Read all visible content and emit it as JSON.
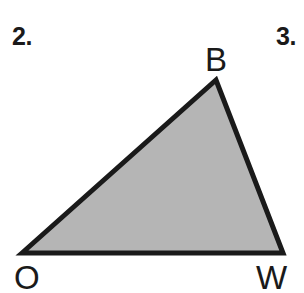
{
  "figure": {
    "background_color": "#ffffff",
    "problem_numbers": [
      {
        "name": "problem-number-2",
        "text": "2."
      },
      {
        "name": "problem-number-3",
        "text": "3."
      }
    ],
    "shape": {
      "kind": "triangle",
      "name": "triangle OBW",
      "fill_color": "#b5b5b5",
      "stroke_color": "#1a1a1a",
      "stroke_width": 5,
      "points": "22,253 216,80 283,253",
      "vertices": [
        {
          "label": "O",
          "x": 22,
          "y": 253
        },
        {
          "label": "B",
          "x": 216,
          "y": 80
        },
        {
          "label": "W",
          "x": 283,
          "y": 253
        }
      ]
    },
    "vertex_labels": {
      "b": "B",
      "o": "O",
      "w": "W"
    }
  }
}
